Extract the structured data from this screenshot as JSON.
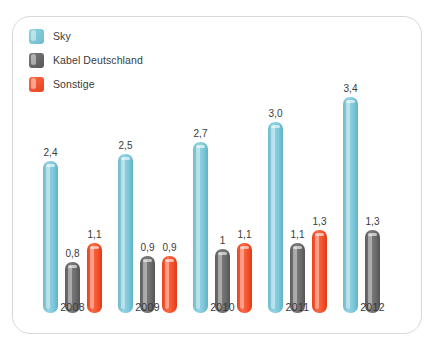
{
  "chart_data": {
    "type": "bar",
    "title": "",
    "subtitle": "",
    "xlabel": "",
    "ylabel": "",
    "ylim": [
      0,
      3.4
    ],
    "grid": false,
    "legend_position": "top-left",
    "categories": [
      "2008",
      "2009",
      "2010",
      "2011",
      "2012"
    ],
    "series": [
      {
        "name": "Sky",
        "color": "#7FCBDC",
        "values": [
          2.4,
          2.5,
          2.7,
          3.0,
          3.4
        ],
        "labels": [
          "2,4",
          "2,5",
          "2,7",
          "3,0",
          "3,4"
        ]
      },
      {
        "name": "Kabel Deutschland",
        "color": "#6E6E6E",
        "values": [
          0.8,
          0.9,
          1.0,
          1.1,
          1.3
        ],
        "labels": [
          "0,8",
          "0,9",
          "1",
          "1,1",
          "1,3"
        ]
      },
      {
        "name": "Sonstige",
        "color": "#F4502A",
        "values": [
          1.1,
          0.9,
          1.1,
          1.3,
          null
        ],
        "labels": [
          "1,1",
          "0,9",
          "1,1",
          "1,3",
          null
        ]
      }
    ]
  },
  "legend": {
    "items": [
      {
        "label": "Sky",
        "color": "#7FCBDC",
        "swatch": "sky"
      },
      {
        "label": "Kabel Deutschland",
        "color": "#6E6E6E",
        "swatch": "kabel"
      },
      {
        "label": "Sonstige",
        "color": "#F4502A",
        "swatch": "sonstige"
      }
    ]
  },
  "panel": {
    "background": "#ffffff",
    "border_color": "#d8d8d8"
  }
}
